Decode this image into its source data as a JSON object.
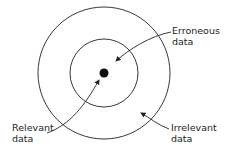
{
  "diagram": {
    "labels": {
      "erroneous": [
        "Erroneous",
        "data"
      ],
      "relevant": [
        "Relevant",
        "data"
      ],
      "irrelevant": [
        "Irrelevant",
        "data"
      ]
    },
    "colors": {
      "stroke": "#222222",
      "background": "#ffffff"
    }
  }
}
